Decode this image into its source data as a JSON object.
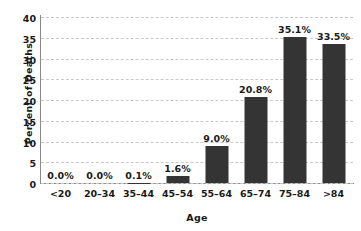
{
  "chart_data": {
    "type": "bar",
    "title": "",
    "xlabel": "Age",
    "ylabel": "Percent of Deaths",
    "categories": [
      "<20",
      "20–34",
      "35–44",
      "45–54",
      "55–64",
      "65–74",
      "75–84",
      ">84"
    ],
    "values": [
      0.0,
      0.0,
      0.1,
      1.6,
      9.0,
      20.8,
      35.1,
      33.5
    ],
    "data_labels": [
      "0.0%",
      "0.0%",
      "0.1%",
      "1.6%",
      "9.0%",
      "20.8%",
      "35.1%",
      "33.5%"
    ],
    "ylim": [
      0,
      40
    ],
    "yticks": [
      0,
      5,
      10,
      15,
      20,
      25,
      30,
      35,
      40
    ],
    "ytick_labels": [
      "0",
      "5",
      "10",
      "15",
      "20",
      "25",
      "30",
      "35",
      "40"
    ],
    "grid": true,
    "grid_axis": "y",
    "grid_style": "dashed",
    "legend": false,
    "bar_color": "#343434",
    "grid_color": "#c9c9c9",
    "axis_color": "#8a8a8a",
    "text_color": "#1a1a1a"
  }
}
